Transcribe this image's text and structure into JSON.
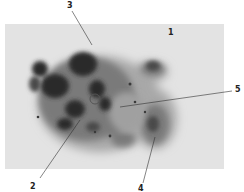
{
  "figure": {
    "type": "micrograph",
    "labels": [
      {
        "id": "1",
        "text": "1",
        "x": 168,
        "y": 29
      },
      {
        "id": "2",
        "text": "2",
        "x": 30,
        "y": 183
      },
      {
        "id": "3",
        "text": "3",
        "x": 67,
        "y": 2
      },
      {
        "id": "4",
        "text": "4",
        "x": 138,
        "y": 185
      },
      {
        "id": "5",
        "text": "5",
        "x": 235,
        "y": 86
      }
    ],
    "colors": {
      "background": "#ffffff",
      "photo_bg": "#e2e2e2",
      "cluster_dark": "#2a2a2a",
      "cluster_mid": "#6a6a6a",
      "leader_line": "#333333"
    }
  }
}
